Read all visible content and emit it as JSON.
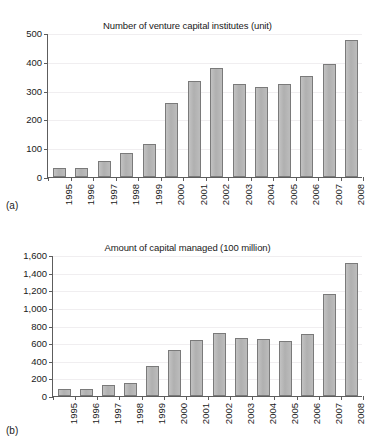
{
  "figure": {
    "panels": [
      {
        "key": "a",
        "label": "(a)",
        "chart_data": {
          "type": "bar",
          "title": "Number of venture capital institutes (unit)",
          "xlabel": "",
          "ylabel": "",
          "categories": [
            "1995",
            "1996",
            "1997",
            "1998",
            "1999",
            "2000",
            "2001",
            "2002",
            "2003",
            "2004",
            "2005",
            "2006",
            "2007",
            "2008"
          ],
          "values": [
            30,
            30,
            57,
            82,
            115,
            258,
            332,
            379,
            323,
            313,
            323,
            350,
            394,
            475
          ],
          "ylim": [
            0,
            500
          ],
          "yticks": [
            0,
            100,
            200,
            300,
            400,
            500
          ],
          "ytick_labels": [
            "0",
            "100",
            "200",
            "300",
            "400",
            "500"
          ],
          "grid": true,
          "legend": false
        }
      },
      {
        "key": "b",
        "label": "(b)",
        "chart_data": {
          "type": "bar",
          "title": "Amount of capital managed (100 million)",
          "xlabel": "",
          "ylabel": "",
          "categories": [
            "1995",
            "1996",
            "1997",
            "1998",
            "1999",
            "2000",
            "2001",
            "2002",
            "2003",
            "2004",
            "2005",
            "2006",
            "2007",
            "2008"
          ],
          "values": [
            85,
            85,
            120,
            152,
            338,
            525,
            640,
            715,
            658,
            645,
            628,
            700,
            1160,
            1510
          ],
          "ylim": [
            0,
            1600
          ],
          "yticks": [
            0,
            200,
            400,
            600,
            800,
            1000,
            1200,
            1400,
            1600
          ],
          "ytick_labels": [
            "0",
            "200",
            "400",
            "600",
            "800",
            "1,000",
            "1,200",
            "1,400",
            "1,600"
          ],
          "grid": true,
          "legend": false
        }
      }
    ],
    "colors": {
      "bar_fill": "#b6b6b6",
      "bar_stroke": "#7a7a7a",
      "axis": "#5d5d5d",
      "grid": "#f0eef0",
      "text": "#1a1a1a",
      "background": "#ffffff"
    }
  }
}
